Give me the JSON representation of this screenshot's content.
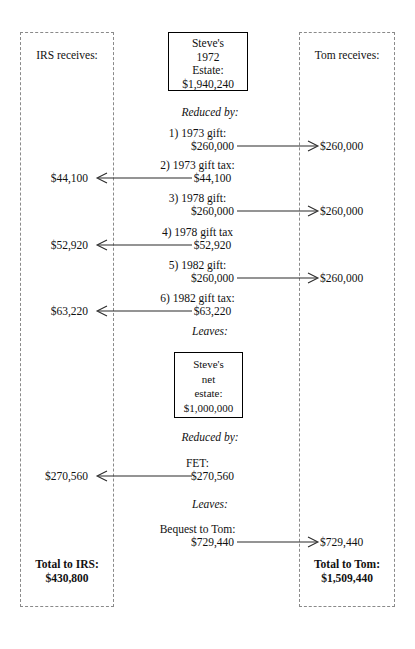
{
  "diagram": {
    "columns": {
      "irs": {
        "heading": "IRS receives:",
        "total_label": "Total to IRS:",
        "total_value": "$430,800"
      },
      "tom": {
        "heading": "Tom receives:",
        "total_label": "Total to Tom:",
        "total_value": "$1,509,440"
      }
    },
    "estate_initial": {
      "line1": "Steve's",
      "line2": "1972",
      "line3": "Estate:",
      "line4": "$1,940,240"
    },
    "estate_net": {
      "line1": "Steve's",
      "line2": "net",
      "line3": "estate:",
      "line4": "$1,000,000"
    },
    "labels": {
      "reduced_by_1": "Reduced by:",
      "reduced_by_2": "Reduced by:",
      "leaves_1": "Leaves:",
      "leaves_2": "Leaves:"
    },
    "deductions": [
      {
        "label": "1) 1973 gift:",
        "amount": "$260,000",
        "to": "tom",
        "side_amount": "$260,000"
      },
      {
        "label": "2) 1973 gift tax:",
        "amount": "$44,100",
        "to": "irs",
        "side_amount": "$44,100"
      },
      {
        "label": "3) 1978 gift:",
        "amount": "$260,000",
        "to": "tom",
        "side_amount": "$260,000"
      },
      {
        "label": "4) 1978 gift tax",
        "amount": "$52,920",
        "to": "irs",
        "side_amount": "$52,920"
      },
      {
        "label": "5) 1982 gift:",
        "amount": "$260,000",
        "to": "tom",
        "side_amount": "$260,000"
      },
      {
        "label": "6) 1982 gift tax:",
        "amount": "$63,220",
        "to": "irs",
        "side_amount": "$63,220"
      }
    ],
    "fet": {
      "label": "FET:",
      "amount": "$270,560",
      "to": "irs",
      "side_amount": "$270,560"
    },
    "bequest": {
      "label": "Bequest to Tom:",
      "amount": "$729,440",
      "to": "tom",
      "side_amount": "$729,440"
    }
  }
}
